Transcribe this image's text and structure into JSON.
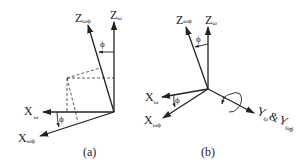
{
  "figure": {
    "panel_a": {
      "caption": "(a)",
      "axes": {
        "z_w": {
          "base": "Z",
          "sub": "ω"
        },
        "z_wphi": {
          "base": "Z",
          "sub": "ωϕ"
        },
        "x_w": {
          "base": "X",
          "sub": "ω"
        },
        "x_wphi": {
          "base": "X",
          "sub": "ωϕ"
        }
      },
      "angle_top": "ϕ",
      "angle_bottom": "ϕ"
    },
    "panel_b": {
      "caption": "(b)",
      "axes": {
        "z_w": {
          "base": "Z",
          "sub": "ω"
        },
        "z_wphi": {
          "base": "Z",
          "sub": "ωϕ"
        },
        "x_w": {
          "base": "X",
          "sub": "ω"
        },
        "x_wphi": {
          "base": "X",
          "sub": "ωϕ"
        },
        "y": {
          "base1": "Y",
          "sub1": "ω",
          "amp": "&",
          "base2": "Y",
          "sub2": "ωϕ"
        }
      },
      "angle_top": "ϕ",
      "angle_bottom": "ϕ"
    }
  }
}
